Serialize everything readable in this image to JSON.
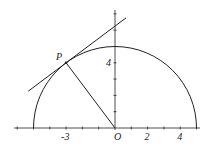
{
  "diagram": {
    "type": "geometry",
    "circle": {
      "center": [
        0,
        0
      ],
      "radius": 5,
      "part": "upper semicircle"
    },
    "point_P": {
      "label": "P",
      "coords": [
        -3,
        4
      ]
    },
    "origin": {
      "label": "O"
    },
    "tangent_line": {
      "equation": "3x - 4y + 25 = 0",
      "through": "P"
    },
    "segment": "OP",
    "x_tick_labels": [
      "-3",
      "2",
      "4"
    ],
    "x_tick_values": [
      -3,
      2,
      4
    ],
    "y_tick_labels": [
      "4"
    ],
    "y_tick_values": [
      4
    ]
  },
  "labels": {
    "P": "P",
    "O": "O",
    "x_neg3": "-3",
    "x_2": "2",
    "x_4": "4",
    "y_4": "4"
  }
}
